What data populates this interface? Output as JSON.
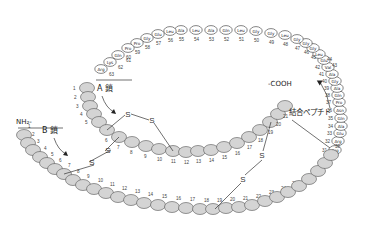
{
  "labels": {
    "a_chain": "A 鎖",
    "b_chain": "B 鎖",
    "nh2": "NH₂-",
    "cooh": "-COOH",
    "c_peptide": "結合ペプチド",
    "s": "S"
  },
  "c_peptide_residues": [
    {
      "n": 31,
      "aa": "Arg"
    },
    {
      "n": 32,
      "aa": "Arg"
    },
    {
      "n": 33,
      "aa": "Glu"
    },
    {
      "n": 34,
      "aa": "Ala"
    },
    {
      "n": 35,
      "aa": "Gln"
    },
    {
      "n": 36,
      "aa": "Asn"
    },
    {
      "n": 37,
      "aa": "Pro"
    },
    {
      "n": 38,
      "aa": "Gln"
    },
    {
      "n": 39,
      "aa": "Ala"
    },
    {
      "n": 40,
      "aa": "Gly"
    },
    {
      "n": 41,
      "aa": "Ala"
    },
    {
      "n": 42,
      "aa": "Val"
    },
    {
      "n": 43,
      "aa": "Glu"
    },
    {
      "n": 44,
      "aa": "Leu"
    },
    {
      "n": 45,
      "aa": "Gly"
    },
    {
      "n": 46,
      "aa": "Gly"
    },
    {
      "n": 47,
      "aa": "Gly"
    },
    {
      "n": 48,
      "aa": "Leu"
    },
    {
      "n": 49,
      "aa": "Gly"
    },
    {
      "n": 50,
      "aa": "Gly"
    },
    {
      "n": 51,
      "aa": "Leu"
    },
    {
      "n": 52,
      "aa": "Gln"
    },
    {
      "n": 53,
      "aa": "Ala"
    },
    {
      "n": 54,
      "aa": "Leu"
    },
    {
      "n": 55,
      "aa": "Ala"
    },
    {
      "n": 56,
      "aa": "Leu"
    },
    {
      "n": 57,
      "aa": "Glu"
    },
    {
      "n": 58,
      "aa": "Gly"
    },
    {
      "n": 59,
      "aa": "Pro"
    },
    {
      "n": 60,
      "aa": "Pro"
    },
    {
      "n": 61,
      "aa": "Gln"
    },
    {
      "n": 62,
      "aa": "Lys"
    },
    {
      "n": 63,
      "aa": "Arg"
    }
  ],
  "a_chain_count": 21,
  "b_chain_count": 30,
  "disulfide_bonds": [
    {
      "from": "A6",
      "to": "A11"
    },
    {
      "from": "A7",
      "to": "B7"
    },
    {
      "from": "A20",
      "to": "B19"
    }
  ]
}
